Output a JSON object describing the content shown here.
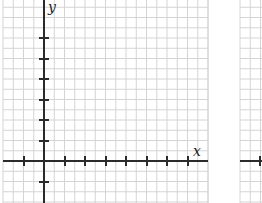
{
  "diagram": {
    "type": "coordinate-grid",
    "colors": {
      "grid": "#d4d4d4",
      "axis": "#2b2b2b",
      "background": "#ffffff"
    },
    "panels": [
      {
        "name": "left-grid",
        "x_label": "x",
        "y_label": "y",
        "x_ticks_px": [
          24,
          65,
          85,
          106,
          126,
          147,
          167,
          188
        ],
        "y_ticks_px": [
          38,
          59,
          79,
          100,
          120,
          141,
          182
        ]
      },
      {
        "name": "right-grid-partial",
        "x_ticks_px": [
          260
        ]
      }
    ]
  }
}
